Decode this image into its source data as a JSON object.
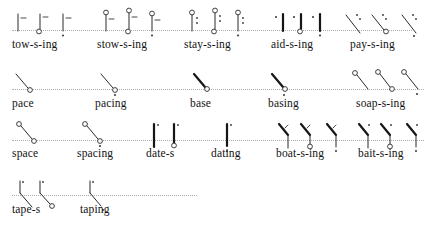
{
  "page": {
    "ink_color": "#161616",
    "baseline_color": "#9aa0a6",
    "paper_color": "#ffffff"
  },
  "rows": [
    {
      "id": "row-1",
      "baseline_y": 30,
      "label_y": 45,
      "baseline_x": 12,
      "baseline_w": 400,
      "groups": [
        {
          "id": "group-tow-s-ing",
          "label": "tow-s-ing",
          "label_x": 12,
          "glyph_x": 14,
          "outline_count": 3,
          "outlines": [
            {
              "name": "tow",
              "type": "upright-tee-with-dash"
            },
            {
              "name": "tow-s",
              "type": "upright-tee-with-dash-and-circle"
            },
            {
              "name": "tow-ing",
              "type": "upright-tee-with-dash-and-dot"
            }
          ]
        },
        {
          "id": "group-stow-s-ing",
          "label": "stow-s-ing",
          "label_x": 97,
          "glyph_x": 102,
          "outline_count": 3,
          "outlines": [
            {
              "name": "stow",
              "type": "upright-tee-circle-top-dash"
            },
            {
              "name": "stow-s",
              "type": "upright-tee-circle-top-dash-circle-bottom"
            },
            {
              "name": "stow-ing",
              "type": "upright-tee-circle-top-dash-dot"
            }
          ]
        },
        {
          "id": "group-stay-s-ing",
          "label": "stay-s-ing",
          "label_x": 184,
          "glyph_x": 188,
          "outline_count": 3,
          "outlines": [
            {
              "name": "stay",
              "type": "upright-tee-circle-top-dots"
            },
            {
              "name": "stay-s",
              "type": "upright-tee-circle-top-dots-circle"
            },
            {
              "name": "stay-ing",
              "type": "upright-tee-circle-top-dots-dot"
            }
          ]
        },
        {
          "id": "group-aid-s-ing",
          "label": "aid-s-ing",
          "label_x": 271,
          "glyph_x": 272,
          "outline_count": 3,
          "outlines": [
            {
              "name": "aid",
              "type": "heavy-dee-dot-left"
            },
            {
              "name": "aid-s",
              "type": "heavy-dee-dot-left-circle"
            },
            {
              "name": "aid-ing",
              "type": "heavy-dee-dot-left-dot-below"
            }
          ]
        },
        {
          "id": "group-pay-s-ing",
          "label": "pay-s-ing",
          "label_x": 350,
          "glyph_x": 344,
          "outline_count": 3,
          "outlines": [
            {
              "name": "pay",
              "type": "diagonal-pee-dot"
            },
            {
              "name": "pay-s",
              "type": "diagonal-pee-dot-circle"
            },
            {
              "name": "pay-ing",
              "type": "diagonal-pee-dot-dot-below"
            }
          ]
        }
      ]
    },
    {
      "id": "row-2",
      "baseline_y": 89,
      "label_y": 104,
      "baseline_x": 12,
      "baseline_w": 412,
      "groups": [
        {
          "id": "group-pace",
          "label": "pace",
          "label_x": 12,
          "glyph_x": 14,
          "outline_count": 1,
          "outlines": [
            {
              "name": "pace",
              "type": "diagonal-pee-circle-end"
            }
          ]
        },
        {
          "id": "group-pacing",
          "label": "pacing",
          "label_x": 95,
          "glyph_x": 99,
          "outline_count": 1,
          "outlines": [
            {
              "name": "pacing",
              "type": "diagonal-pee-circle-end-dot"
            }
          ]
        },
        {
          "id": "group-base",
          "label": "base",
          "label_x": 190,
          "glyph_x": 192,
          "outline_count": 1,
          "outlines": [
            {
              "name": "base",
              "type": "heavy-bee-circle-end"
            }
          ]
        },
        {
          "id": "group-basing",
          "label": "basing",
          "label_x": 268,
          "glyph_x": 270,
          "outline_count": 1,
          "outlines": [
            {
              "name": "basing",
              "type": "heavy-bee-circle-end-dot"
            }
          ]
        },
        {
          "id": "group-soap-s-ing",
          "label": "soap-s-ing",
          "label_x": 356,
          "glyph_x": 352,
          "outline_count": 3,
          "outlines": [
            {
              "name": "soap",
              "type": "circle-top-diagonal-pee"
            },
            {
              "name": "soap-s",
              "type": "circle-top-diagonal-pee-circle-end"
            },
            {
              "name": "soap-ing",
              "type": "circle-top-diagonal-pee-dot"
            }
          ]
        }
      ]
    },
    {
      "id": "row-3",
      "baseline_y": 140,
      "label_y": 156,
      "baseline_x": 12,
      "baseline_w": 412,
      "groups": [
        {
          "id": "group-space",
          "label": "space",
          "label_x": 12,
          "glyph_x": 16,
          "outline_count": 1,
          "outlines": [
            {
              "name": "space",
              "type": "circle-top-diagonal-pee-circle-end"
            }
          ]
        },
        {
          "id": "group-spacing",
          "label": "spacing",
          "label_x": 77,
          "glyph_x": 82,
          "outline_count": 1,
          "outlines": [
            {
              "name": "spacing",
              "type": "circle-top-diagonal-pee-circle-end-dot"
            }
          ]
        },
        {
          "id": "group-date-s",
          "label": "date-s",
          "label_x": 146,
          "glyph_x": 150,
          "outline_count": 2,
          "outlines": [
            {
              "name": "date",
              "type": "heavy-dee-vertical-tick"
            },
            {
              "name": "date-s",
              "type": "heavy-dee-vertical-tick-circle"
            }
          ]
        },
        {
          "id": "group-dating",
          "label": "dating",
          "label_x": 211,
          "glyph_x": 223,
          "outline_count": 1,
          "outlines": [
            {
              "name": "dating",
              "type": "heavy-dee-vertical-tick-dot"
            }
          ]
        },
        {
          "id": "group-boat-s-ing",
          "label": "boat-s-ing",
          "label_x": 276,
          "glyph_x": 277,
          "outline_count": 3,
          "outlines": [
            {
              "name": "boat",
              "type": "bee-tee-angle"
            },
            {
              "name": "boat-s",
              "type": "bee-tee-angle-circle"
            },
            {
              "name": "boat-ing",
              "type": "bee-tee-angle-dot"
            }
          ]
        },
        {
          "id": "group-bait-s-ing",
          "label": "bait-s-ing",
          "label_x": 358,
          "glyph_x": 357,
          "outline_count": 3,
          "outlines": [
            {
              "name": "bait",
              "type": "bee-tee-angle-dotted"
            },
            {
              "name": "bait-s",
              "type": "bee-tee-angle-dotted-circle"
            },
            {
              "name": "bait-ing",
              "type": "bee-tee-angle-dotted-dot"
            }
          ]
        }
      ]
    },
    {
      "id": "row-4",
      "baseline_y": 195,
      "label_y": 210,
      "baseline_x": 12,
      "baseline_w": 185,
      "groups": [
        {
          "id": "group-tape-s",
          "label": "tape-s",
          "label_x": 12,
          "glyph_x": 16,
          "outline_count": 2,
          "outlines": [
            {
              "name": "tape",
              "type": "pee-tee-angle"
            },
            {
              "name": "tape-s",
              "type": "pee-tee-angle-circle"
            }
          ]
        },
        {
          "id": "group-taping",
          "label": "taping",
          "label_x": 80,
          "glyph_x": 86,
          "outline_count": 1,
          "outlines": [
            {
              "name": "taping",
              "type": "pee-tee-angle-dot"
            }
          ]
        }
      ]
    }
  ]
}
